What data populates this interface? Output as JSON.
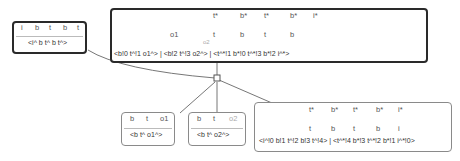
{
  "nodes": {
    "source": {
      "tokens": [
        "i",
        "b",
        "t",
        "b",
        "t"
      ],
      "signature": "<i^ b t^ b t^>"
    },
    "main": {
      "top_tokens": [
        "t*",
        "b*",
        "t*",
        "b*",
        "i*"
      ],
      "bottom_tokens": [
        "o1",
        "t",
        "b",
        "t",
        "b"
      ],
      "loop_label": "o2",
      "signature": "<b!0 t^!1 o1^> | <b!2 t^!3 o2^> | <t^*!1 b*!0 t^*!3 b*!2 i^*>"
    },
    "child1": {
      "tokens": [
        "b",
        "t",
        "o1"
      ],
      "signature": "<b t^ o1^>"
    },
    "child2": {
      "tokens": [
        "b",
        "t",
        "o2"
      ],
      "signature": "<b t^ o2^>"
    },
    "product": {
      "top_tokens": [
        "t*",
        "b*",
        "t*",
        "b*",
        "i*"
      ],
      "bottom_tokens": [
        "t",
        "b",
        "t",
        "b",
        "i"
      ],
      "signature": "<i^!0 b!1 t^!2 b!3 t^!4> | <t^*!4 b*!3 t^*!2 b*!1 i^*!0>"
    }
  },
  "colors": {
    "strand": "#555555",
    "strand_light": "#aaaaaa",
    "border_dark": "#2a2a2a",
    "border_light": "#8a8a8a"
  }
}
